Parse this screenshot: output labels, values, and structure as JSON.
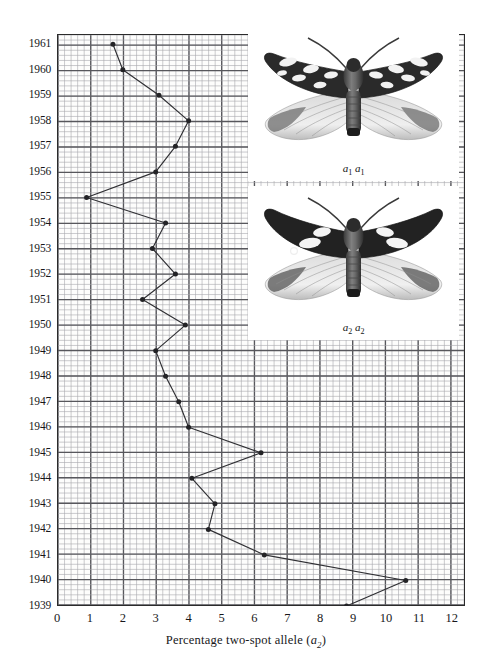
{
  "chart_data": {
    "type": "line",
    "title": "",
    "xlabel": "Percentage two-spot allele (a2)",
    "ylabel": "",
    "orientation": "horizontal-value-vertical-year",
    "xlim": [
      0,
      12.4
    ],
    "ylim": [
      1939,
      1961.4
    ],
    "grid": true,
    "grid_minor": true,
    "legend": "none",
    "x_ticks": [
      0,
      1,
      2,
      3,
      4,
      5,
      6,
      7,
      8,
      9,
      10,
      11,
      12
    ],
    "x_tick_labels": [
      "0",
      "1",
      "2",
      "3",
      "4",
      "5",
      "6",
      "7",
      "8",
      "9",
      "10",
      "11",
      "12"
    ],
    "y_ticks": [
      1939,
      1940,
      1941,
      1942,
      1943,
      1944,
      1945,
      1946,
      1947,
      1948,
      1949,
      1950,
      1951,
      1952,
      1953,
      1954,
      1955,
      1956,
      1957,
      1958,
      1959,
      1960,
      1961
    ],
    "y_tick_labels": [
      "1939",
      "1940",
      "1941",
      "1942",
      "1943",
      "1944",
      "1945",
      "1946",
      "1947",
      "1948",
      "1949",
      "1950",
      "1951",
      "1952",
      "1953",
      "1954",
      "1955",
      "1956",
      "1957",
      "1958",
      "1959",
      "1960",
      "1961"
    ],
    "series": [
      {
        "name": "Percentage two-spot allele (a2)",
        "color": "#2f2f33",
        "marker": "filled-circle",
        "years": [
          1939,
          1940,
          1941,
          1942,
          1943,
          1944,
          1945,
          1946,
          1947,
          1948,
          1949,
          1950,
          1951,
          1952,
          1953,
          1954,
          1955,
          1956,
          1957,
          1958,
          1959,
          1960,
          1961
        ],
        "values": [
          8.8,
          10.6,
          6.3,
          4.6,
          4.8,
          4.1,
          6.2,
          4.0,
          3.7,
          3.3,
          3.0,
          3.2,
          4.4,
          2.6,
          3.6,
          2.9,
          3.3,
          0.9,
          3.0,
          3.6,
          4.0,
          3.1,
          2.0,
          1.7
        ]
      }
    ],
    "points": [
      {
        "year": 1939,
        "value": 8.8
      },
      {
        "year": 1940,
        "value": 10.6
      },
      {
        "year": 1941,
        "value": 6.3
      },
      {
        "year": 1942,
        "value": 4.6
      },
      {
        "year": 1943,
        "value": 4.8
      },
      {
        "year": 1944,
        "value": 4.1
      },
      {
        "year": 1945,
        "value": 6.2
      },
      {
        "year": 1946,
        "value": 4.0
      },
      {
        "year": 1947,
        "value": 3.7
      },
      {
        "year": 1948,
        "value": 3.3
      },
      {
        "year": 1949,
        "value": 3.0
      },
      {
        "year": 1950,
        "value": 3.9
      },
      {
        "year": 1951,
        "value": 2.6
      },
      {
        "year": 1952,
        "value": 3.6
      },
      {
        "year": 1953,
        "value": 2.9
      },
      {
        "year": 1954,
        "value": 3.3
      },
      {
        "year": 1955,
        "value": 0.9
      },
      {
        "year": 1956,
        "value": 3.0
      },
      {
        "year": 1957,
        "value": 3.6
      },
      {
        "year": 1958,
        "value": 4.0
      },
      {
        "year": 1959,
        "value": 3.1
      },
      {
        "year": 1960,
        "value": 2.0
      },
      {
        "year": 1961,
        "value": 1.7
      }
    ]
  },
  "axes": {
    "x_title_prefix": "Percentage two-spot allele (",
    "x_title_symbol": "a",
    "x_title_subscript": "2",
    "x_title_suffix": ")"
  },
  "insets": [
    {
      "name": "moth-a1a1",
      "caption_symbol": "a",
      "caption_sub": "1",
      "caption": "a1 a1",
      "description": "dark-forewing moth with pale spots, genotype a1 a1"
    },
    {
      "name": "moth-a2a2",
      "caption_symbol": "a",
      "caption_sub": "2",
      "caption": "a2 a2",
      "description": "dark-forewing moth with two large pale spots, genotype a2 a2"
    }
  ],
  "colors": {
    "line": "#2f2f33",
    "marker": "#232326",
    "grid_major": "#57575c",
    "grid_minor": "#a8a8ad",
    "frame": "#2b2b2b",
    "text": "#17171a",
    "plot_background": "#fdfdfc"
  }
}
